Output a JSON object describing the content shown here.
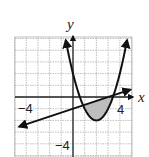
{
  "chart_data": {
    "type": "line",
    "title": "",
    "xlabel": "x",
    "ylabel": "y",
    "xlim": [
      -5,
      5
    ],
    "ylim": [
      -5,
      5
    ],
    "grid": true,
    "tick_labels": {
      "x": [
        {
          "value": -4,
          "label": "−4"
        },
        {
          "value": 4,
          "label": "4"
        }
      ],
      "y": [
        {
          "value": -4,
          "label": "−4"
        }
      ]
    },
    "series": [
      {
        "name": "parabola",
        "equation": "y = (x - 2)^2 - 2",
        "vertex": [
          2,
          -2
        ],
        "style": "arrows-both-ends"
      },
      {
        "name": "line",
        "equation": "y = x/3 - 1",
        "style": "arrows-both-ends"
      }
    ],
    "shaded_region": {
      "between": [
        "line",
        "parabola"
      ],
      "x_range": [
        0.87,
        3.47
      ],
      "color": "#bdbdbd"
    },
    "annotations": []
  },
  "labels": {
    "x_axis": "x",
    "y_axis": "y",
    "x_neg4": "−4",
    "x_pos4": "4",
    "y_neg4": "−4"
  },
  "colors": {
    "grid": "#b0b0b0",
    "axis": "#222222",
    "curve": "#111111",
    "shade": "#bdbdbd"
  }
}
